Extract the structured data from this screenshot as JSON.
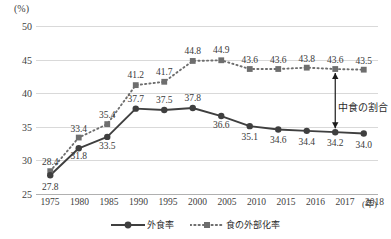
{
  "chart_data": {
    "type": "line",
    "title": "",
    "xlabel": "(年)",
    "ylabel": "(%)",
    "categories": [
      "1975",
      "1980",
      "1985",
      "1990",
      "1995",
      "2000",
      "2005",
      "2010",
      "2015",
      "2016",
      "2017",
      "2018"
    ],
    "ylim": [
      25,
      50
    ],
    "yticks": [
      25,
      30,
      35,
      40,
      45,
      50
    ],
    "grid": true,
    "legend_position": "bottom",
    "series": [
      {
        "name": "外食率",
        "style": "solid",
        "marker": "circle",
        "color": "#3f3f3f",
        "values": [
          27.8,
          31.8,
          33.5,
          37.7,
          37.5,
          37.8,
          36.6,
          35.1,
          34.6,
          34.4,
          34.2,
          34.0
        ]
      },
      {
        "name": "食の外部化率",
        "style": "dotted",
        "marker": "square",
        "color": "#6e6e6e",
        "values": [
          28.4,
          33.4,
          35.4,
          41.2,
          41.7,
          44.8,
          44.9,
          43.6,
          43.6,
          43.8,
          43.6,
          43.5
        ]
      }
    ],
    "annotations": [
      {
        "text": "中食の割合",
        "type": "double-arrow",
        "at_category": "2017",
        "from_value": 43.6,
        "to_value": 34.2
      }
    ]
  },
  "legend": {
    "items": [
      {
        "label": "外食率"
      },
      {
        "label": "食の外部化率"
      }
    ]
  }
}
